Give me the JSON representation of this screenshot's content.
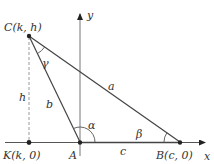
{
  "diagram": {
    "type": "triangle-in-coordinate-plane",
    "axes": {
      "x_label": "x",
      "y_label": "y"
    },
    "points": {
      "C": {
        "name": "C",
        "coords": "(k, h)",
        "label": "C(k, h)"
      },
      "A": {
        "name": "A",
        "label": "A"
      },
      "B": {
        "name": "B",
        "coords": "(c, 0)",
        "label": "B(c, 0)"
      },
      "K": {
        "name": "K",
        "coords": "(k, 0)",
        "label": "K(k, 0)"
      }
    },
    "sides": {
      "a": "a",
      "b": "b",
      "c": "c",
      "h": "h"
    },
    "angles": {
      "alpha": "α",
      "beta": "β",
      "gamma": "γ"
    },
    "colors": {
      "line": "#444444",
      "axis": "#555555",
      "dashed": "#999999",
      "point": "#222222"
    }
  }
}
